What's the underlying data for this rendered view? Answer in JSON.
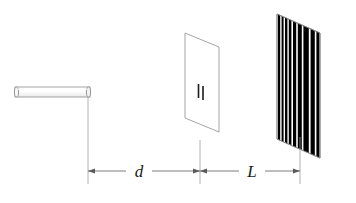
{
  "figure": {
    "background_color": "#ffffff",
    "line_color": "#8a8a8a",
    "dim_line_color": "#5a5a5a",
    "fringe_color": "#000000",
    "label_color": "#1a1a1a",
    "width": 356,
    "height": 203
  },
  "source": {
    "name": "laser-source",
    "shape": "horizontal-cylinder",
    "x": 15,
    "y": 87,
    "width": 75,
    "height": 10,
    "outline_color": "#9a9a9a",
    "fill_color": "#fdfdfd"
  },
  "barrier": {
    "name": "double-slit-barrier",
    "shape": "parallelogram",
    "points": "185,33 219,47 219,132 185,118",
    "outline_color": "#9a9a9a",
    "fill_color": "#ffffff",
    "slits": [
      {
        "x": 198.5,
        "y_top": 84,
        "y_bottom": 98,
        "width": 1.6
      },
      {
        "x": 203.0,
        "y_top": 86,
        "y_bottom": 100,
        "width": 1.6
      }
    ],
    "slit_color": "#1c1c1c"
  },
  "screen": {
    "name": "interference-screen",
    "shape": "parallelogram",
    "points": "277,14 320,33 320,158 277,139",
    "outline_color": "#8a8a8a",
    "fill_color": "#ffffff",
    "fringe_color": "#000000",
    "fringes": [
      {
        "x": 278.0,
        "w": 2.2
      },
      {
        "x": 281.6,
        "w": 2.0
      },
      {
        "x": 285.0,
        "w": 2.4
      },
      {
        "x": 288.8,
        "w": 2.6
      },
      {
        "x": 293.0,
        "w": 3.2
      },
      {
        "x": 297.8,
        "w": 4.0
      },
      {
        "x": 303.4,
        "w": 5.4
      },
      {
        "x": 310.6,
        "w": 4.2
      },
      {
        "x": 316.4,
        "w": 3.0
      },
      {
        "x": 320.8,
        "w": 2.4
      },
      {
        "x": 324.6,
        "w": 2.0
      },
      {
        "x": 328.0,
        "w": 1.8
      },
      {
        "x": 331.0,
        "w": 1.8
      },
      {
        "x": 334.0,
        "w": 1.6
      },
      {
        "x": 336.8,
        "w": 1.6
      },
      {
        "x": 339.4,
        "w": 1.4
      }
    ]
  },
  "dimensions": {
    "baseline_y": 171,
    "extension_lines": [
      {
        "name": "extension-line-source",
        "x": 88,
        "y_top": 97,
        "y_bottom": 184
      },
      {
        "name": "extension-line-barrier",
        "x": 200,
        "y_top": 140,
        "y_bottom": 184
      },
      {
        "name": "extension-line-screen",
        "x": 300,
        "y_top": 137,
        "y_bottom": 184
      }
    ],
    "segments": [
      {
        "name": "dimension-d",
        "label": "d",
        "label_x": 139,
        "label_y": 177,
        "x_start": 88,
        "x_end": 200,
        "arrow_left": true,
        "arrow_right": true
      },
      {
        "name": "dimension-L",
        "label": "L",
        "label_x": 252,
        "label_y": 177,
        "x_start": 200,
        "x_end": 300,
        "arrow_left": true,
        "arrow_right": true
      }
    ]
  },
  "annotations": {
    "distance_d_description": "separation between light source and double-slit barrier",
    "distance_L_description": "separation between double-slit barrier and viewing screen"
  }
}
